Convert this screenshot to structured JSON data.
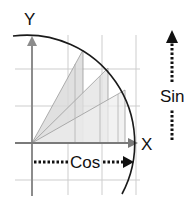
{
  "diagram": {
    "labels": {
      "y_axis": "Y",
      "x_axis": "X",
      "cos": "Cos",
      "sin": "Sin"
    },
    "colors": {
      "grid": "#c8c8c8",
      "axis": "#8a8a8a",
      "arc": "#1a1a1a",
      "triangle_fill_1": "#d9d9d9",
      "triangle_fill_2": "#e6e6e6",
      "triangle_fill_3": "#efefef",
      "triangle_stroke": "#9a9a9a",
      "dotted_arrow": "#111111"
    },
    "triangles": [
      {
        "name": "triangle-steep",
        "apex": [
          83,
          50
        ]
      },
      {
        "name": "triangle-mid",
        "apex": [
          108,
          68
        ]
      },
      {
        "name": "triangle-shallow",
        "apex": [
          125,
          90
        ]
      }
    ]
  }
}
